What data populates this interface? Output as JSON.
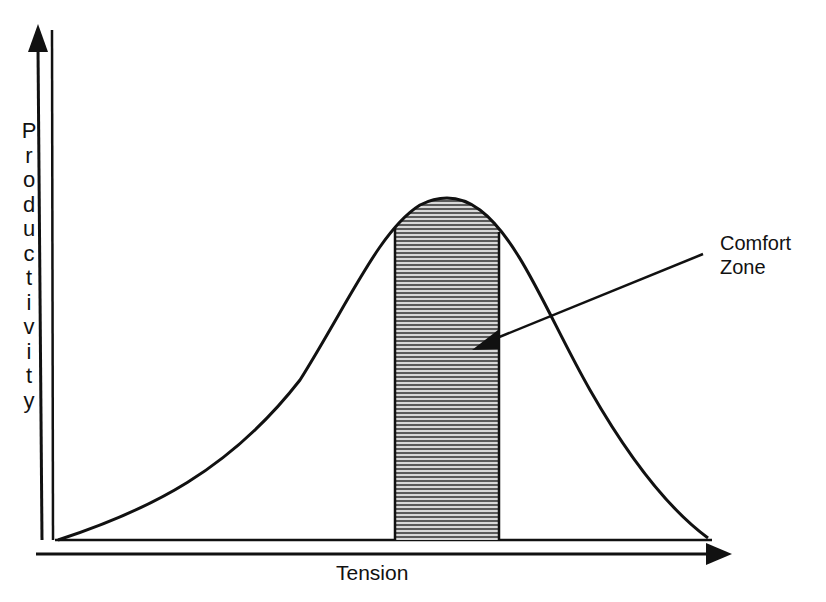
{
  "chart_data": {
    "type": "area",
    "title": "",
    "xlabel": "Tension",
    "ylabel": "Productivity",
    "curve": {
      "shape": "bell",
      "x": [
        0,
        0.1,
        0.2,
        0.3,
        0.4,
        0.5,
        0.55,
        0.6,
        0.7,
        0.8,
        0.9,
        1.0
      ],
      "y": [
        0.0,
        0.08,
        0.22,
        0.45,
        0.75,
        0.97,
        1.0,
        0.96,
        0.7,
        0.38,
        0.12,
        0.0
      ]
    },
    "shaded_region": {
      "label": "Comfort Zone",
      "x_start": 0.52,
      "x_end": 0.68,
      "pattern": "horizontal-lines"
    },
    "annotations": [
      {
        "text": "Comfort Zone",
        "arrow_to": "shaded_region"
      }
    ],
    "axes": {
      "ticks": false,
      "grid": false,
      "arrows": true
    }
  },
  "labels": {
    "y_axis": "Productivity",
    "x_axis": "Tension",
    "annotation_line1": "Comfort",
    "annotation_line2": "Zone"
  },
  "colors": {
    "ink": "#111111",
    "background": "#ffffff",
    "hatch": "#444444"
  }
}
